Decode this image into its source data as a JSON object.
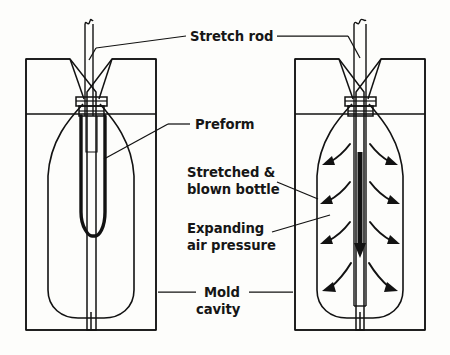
{
  "figure": {
    "type": "technical-line-diagram",
    "background_color": "#fdfdfb",
    "ink_color": "#121212",
    "panels": [
      {
        "id": "left-panel",
        "name": "preform-in-mold",
        "caption": "Preform positioned in closed mold before stretching",
        "stage": 1
      },
      {
        "id": "right-panel",
        "name": "stretched-blown-bottle-in-mold",
        "caption": "Preform stretched by rod and blown against mold cavity walls",
        "stage": 2
      }
    ]
  },
  "labels": {
    "stretch_rod": "Stretch rod",
    "preform": "Preform",
    "stretched_blown_bottle_line1": "Stretched &",
    "stretched_blown_bottle_line2": "blown bottle",
    "expanding_air_line1": "Expanding",
    "expanding_air_line2": "air pressure",
    "mold_cavity_line1": "Mold",
    "mold_cavity_line2": "cavity"
  },
  "annotations": {
    "air_flow_arrow_count": 8,
    "air_flow_rows": 4,
    "stretch_direction": "downward",
    "rod_break_symbol": "true"
  }
}
